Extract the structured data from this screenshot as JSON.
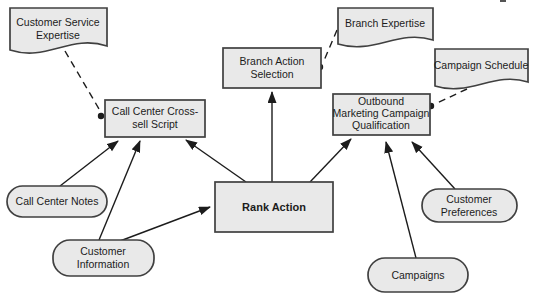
{
  "diagram": {
    "type": "decision-requirements-diagram",
    "background": "#ffffff",
    "palette": {
      "shape_fill": "#e9e9e9",
      "shape_stroke": "#404040",
      "connector_color": "#1c1c1c",
      "text_color": "#1c1c1c"
    },
    "nodes": {
      "customer_service_expertise": {
        "shape": "document",
        "lines": [
          "Customer Service",
          "Expertise"
        ]
      },
      "branch_expertise": {
        "shape": "document",
        "lines": [
          "Branch Expertise"
        ]
      },
      "campaign_schedule": {
        "shape": "document",
        "lines": [
          "Campaign Schedule"
        ]
      },
      "branch_action_selection": {
        "shape": "rectangle",
        "lines": [
          "Branch Action",
          "Selection"
        ]
      },
      "call_center_cross_sell_script": {
        "shape": "rectangle",
        "lines": [
          "Call Center Cross-",
          "sell Script"
        ]
      },
      "outbound_marketing_campaign_qualification": {
        "shape": "rectangle",
        "lines": [
          "Outbound",
          "Marketing Campaign",
          "Qualification"
        ]
      },
      "rank_action": {
        "shape": "rectangle",
        "emphasis": "bold",
        "lines": [
          "Rank Action"
        ]
      },
      "call_center_notes": {
        "shape": "stadium",
        "lines": [
          "Call Center Notes"
        ]
      },
      "customer_information": {
        "shape": "stadium",
        "lines": [
          "Customer",
          "Information"
        ]
      },
      "campaigns": {
        "shape": "stadium",
        "lines": [
          "Campaigns"
        ]
      },
      "customer_preferences": {
        "shape": "stadium",
        "lines": [
          "Customer",
          "Preferences"
        ]
      }
    },
    "edges": [
      {
        "from": "customer_service_expertise",
        "to": "call_center_cross_sell_script",
        "style": "dashed-dot"
      },
      {
        "from": "branch_expertise",
        "to": "branch_action_selection",
        "style": "dashed-dot"
      },
      {
        "from": "campaign_schedule",
        "to": "outbound_marketing_campaign_qualification",
        "style": "dashed-dot"
      },
      {
        "from": "call_center_notes",
        "to": "call_center_cross_sell_script",
        "style": "solid-arrow"
      },
      {
        "from": "customer_information",
        "to": "call_center_cross_sell_script",
        "style": "solid-arrow"
      },
      {
        "from": "customer_information",
        "to": "rank_action",
        "style": "solid-arrow"
      },
      {
        "from": "rank_action",
        "to": "call_center_cross_sell_script",
        "style": "solid-arrow"
      },
      {
        "from": "rank_action",
        "to": "branch_action_selection",
        "style": "solid-arrow"
      },
      {
        "from": "rank_action",
        "to": "outbound_marketing_campaign_qualification",
        "style": "solid-arrow"
      },
      {
        "from": "campaigns",
        "to": "outbound_marketing_campaign_qualification",
        "style": "solid-arrow"
      },
      {
        "from": "customer_preferences",
        "to": "outbound_marketing_campaign_qualification",
        "style": "solid-arrow"
      }
    ]
  }
}
